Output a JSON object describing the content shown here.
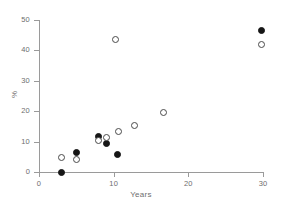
{
  "chart_data": {
    "type": "scatter",
    "title": "",
    "xlabel": "Years",
    "ylabel": "%",
    "xlim": [
      0,
      30
    ],
    "ylim": [
      0,
      50
    ],
    "xticks": [
      0,
      10,
      20,
      30
    ],
    "yticks": [
      0,
      10,
      20,
      30,
      40,
      50
    ],
    "grid": false,
    "legend": "none",
    "series": [
      {
        "name": "filled-circles",
        "marker": "filled circle",
        "color": "#161616",
        "points": [
          {
            "x": 3.0,
            "y": 0.0
          },
          {
            "x": 5.0,
            "y": 6.3
          },
          {
            "x": 8.0,
            "y": 11.8
          },
          {
            "x": 9.0,
            "y": 9.5
          },
          {
            "x": 10.5,
            "y": 5.7
          },
          {
            "x": 29.8,
            "y": 46.5
          }
        ]
      },
      {
        "name": "open-circles",
        "marker": "open circle",
        "color": "#4a4a4a",
        "points": [
          {
            "x": 3.0,
            "y": 4.7
          },
          {
            "x": 5.0,
            "y": 4.0
          },
          {
            "x": 8.0,
            "y": 10.2
          },
          {
            "x": 9.0,
            "y": 11.5
          },
          {
            "x": 10.3,
            "y": 43.5
          },
          {
            "x": 10.6,
            "y": 13.2
          },
          {
            "x": 12.8,
            "y": 15.4
          },
          {
            "x": 16.7,
            "y": 19.7
          },
          {
            "x": 29.8,
            "y": 42.0
          }
        ]
      }
    ]
  }
}
